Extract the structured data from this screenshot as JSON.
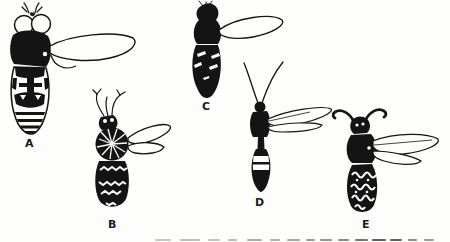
{
  "page": {
    "background": "#fdfdfb",
    "ink": "#141414",
    "kind": "printed book figure, black-ink insect line drawings on white"
  },
  "figure": {
    "items": [
      {
        "id": "A",
        "label": "A",
        "name": "large-eyed-fly-drawing"
      },
      {
        "id": "B",
        "label": "B",
        "name": "furry-bee-drawing"
      },
      {
        "id": "C",
        "label": "C",
        "name": "dark-bodied-fly-drawing"
      },
      {
        "id": "D",
        "label": "D",
        "name": "slender-long-antenna-wasp-drawing"
      },
      {
        "id": "E",
        "label": "E",
        "name": "banded-wasp-drawing"
      }
    ]
  }
}
